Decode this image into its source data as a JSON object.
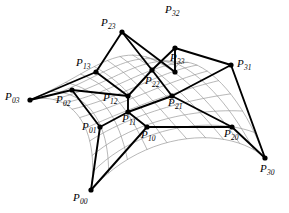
{
  "figure": {
    "width": 289,
    "height": 213,
    "background_color": "#ffffff",
    "control_net_color": "#000000",
    "surface_mesh_color": "#9a9a9a",
    "point_marker_color": "#000000"
  },
  "control_points": [
    {
      "id": "P00",
      "name": "P",
      "subscript": "00",
      "x": 91,
      "y": 190,
      "label_x": 73,
      "label_y": 192,
      "marker": true
    },
    {
      "id": "P01",
      "name": "P",
      "subscript": "01",
      "x": 100,
      "y": 127,
      "label_x": 82,
      "label_y": 121,
      "marker": true
    },
    {
      "id": "P02",
      "name": "P",
      "subscript": "02",
      "x": 72,
      "y": 90,
      "label_x": 56,
      "label_y": 94,
      "marker": true
    },
    {
      "id": "P03",
      "name": "P",
      "subscript": "03",
      "x": 30,
      "y": 100,
      "label_x": 5,
      "label_y": 91,
      "marker": true
    },
    {
      "id": "P10",
      "name": "P",
      "subscript": "10",
      "x": 147,
      "y": 127,
      "label_x": 141,
      "label_y": 129,
      "marker": true
    },
    {
      "id": "P11",
      "name": "P",
      "subscript": "11",
      "x": 128,
      "y": 112,
      "label_x": 122,
      "label_y": 113,
      "marker": true
    },
    {
      "id": "P12",
      "name": "P",
      "subscript": "12",
      "x": 128,
      "y": 96,
      "label_x": 103,
      "label_y": 92,
      "marker": true
    },
    {
      "id": "P13",
      "name": "P",
      "subscript": "13",
      "x": 96,
      "y": 72,
      "label_x": 76,
      "label_y": 57,
      "marker": true
    },
    {
      "id": "P20",
      "name": "P",
      "subscript": "20",
      "x": 232,
      "y": 127,
      "label_x": 224,
      "label_y": 128,
      "marker": true
    },
    {
      "id": "P21",
      "name": "P",
      "subscript": "21",
      "x": 172,
      "y": 96,
      "label_x": 168,
      "label_y": 97,
      "marker": true
    },
    {
      "id": "P22",
      "name": "P",
      "subscript": "22",
      "x": 152,
      "y": 70,
      "label_x": 145,
      "label_y": 75,
      "marker": true
    },
    {
      "id": "P23",
      "name": "P",
      "subscript": "23",
      "x": 122,
      "y": 32,
      "label_x": 101,
      "label_y": 17,
      "marker": true
    },
    {
      "id": "P30",
      "name": "P",
      "subscript": "30",
      "x": 265,
      "y": 158,
      "label_x": 260,
      "label_y": 163,
      "marker": true
    },
    {
      "id": "P31",
      "name": "P",
      "subscript": "31",
      "x": 231,
      "y": 65,
      "label_x": 237,
      "label_y": 58,
      "marker": true
    },
    {
      "id": "P32",
      "name": "P",
      "subscript": "32",
      "x": 175,
      "y": 48,
      "label_x": 165,
      "label_y": 4,
      "marker": true
    },
    {
      "id": "P33",
      "name": "P",
      "subscript": "33",
      "x": 175,
      "y": 72,
      "label_x": 170,
      "label_y": 52,
      "marker": true
    }
  ],
  "control_net_edges": [
    [
      "P00",
      "P01"
    ],
    [
      "P01",
      "P02"
    ],
    [
      "P02",
      "P03"
    ],
    [
      "P10",
      "P11"
    ],
    [
      "P11",
      "P12"
    ],
    [
      "P12",
      "P13"
    ],
    [
      "P20",
      "P21"
    ],
    [
      "P21",
      "P22"
    ],
    [
      "P22",
      "P23"
    ],
    [
      "P30",
      "P31"
    ],
    [
      "P31",
      "P32"
    ],
    [
      "P32",
      "P33"
    ],
    [
      "P00",
      "P10"
    ],
    [
      "P10",
      "P20"
    ],
    [
      "P20",
      "P30"
    ],
    [
      "P01",
      "P11"
    ],
    [
      "P11",
      "P21"
    ],
    [
      "P21",
      "P31"
    ],
    [
      "P02",
      "P12"
    ],
    [
      "P12",
      "P22"
    ],
    [
      "P22",
      "P32"
    ],
    [
      "P03",
      "P13"
    ],
    [
      "P13",
      "P23"
    ],
    [
      "P23",
      "P33"
    ]
  ],
  "surface": {
    "description": "Bicubic Bezier patch drawn as gray isoparametric wireframe",
    "u_divisions": 10,
    "v_divisions": 10,
    "corner_points": [
      "P00",
      "P03",
      "P30",
      "P33"
    ]
  }
}
